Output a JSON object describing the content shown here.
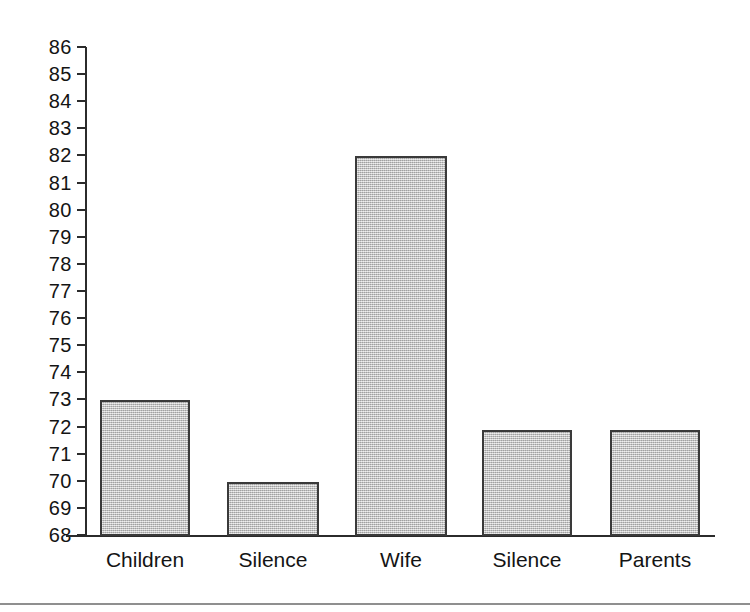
{
  "chart_data": {
    "type": "bar",
    "title": "",
    "subtitle": "",
    "xlabel": "",
    "ylabel": "",
    "categories": [
      "Children",
      "Silence",
      "Wife",
      "Silence",
      "Parents"
    ],
    "values": [
      73,
      70,
      82,
      71.9,
      71.9
    ],
    "series": [
      {
        "name": "",
        "values": [
          73,
          70,
          82,
          71.9,
          71.9
        ]
      }
    ],
    "ylim": [
      68,
      86
    ],
    "ytick_labels": [
      "68",
      "69",
      "70",
      "71",
      "72",
      "73",
      "74",
      "75",
      "76",
      "77",
      "78",
      "79",
      "80",
      "81",
      "82",
      "83",
      "84",
      "85",
      "86"
    ],
    "ytick_values": [
      68,
      69,
      70,
      71,
      72,
      73,
      74,
      75,
      76,
      77,
      78,
      79,
      80,
      81,
      82,
      83,
      84,
      85,
      86
    ],
    "grid": false,
    "legend": false,
    "legend_position": "none",
    "annotations": [],
    "bar_fill_color": "#c2c2c2",
    "bar_border_color": "#3a3a3a",
    "axis_color": "#2b2b2b",
    "text_color": "#141414",
    "background_color": "#ffffff",
    "rule_color": "#8f8f8f"
  }
}
